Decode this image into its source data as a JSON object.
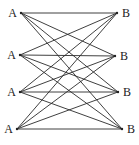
{
  "diagram": {
    "type": "complete-bipartite-graph",
    "name": "K4,4",
    "left_nodes": [
      {
        "id": "A1",
        "label": "A"
      },
      {
        "id": "A2",
        "label": "A"
      },
      {
        "id": "A3",
        "label": "A"
      },
      {
        "id": "A4",
        "label": "A"
      }
    ],
    "right_nodes": [
      {
        "id": "B1",
        "label": "B"
      },
      {
        "id": "B2",
        "label": "B"
      },
      {
        "id": "B3",
        "label": "B"
      },
      {
        "id": "B4",
        "label": "B"
      }
    ],
    "edges": [
      [
        "A1",
        "B1"
      ],
      [
        "A1",
        "B2"
      ],
      [
        "A1",
        "B3"
      ],
      [
        "A1",
        "B4"
      ],
      [
        "A2",
        "B1"
      ],
      [
        "A2",
        "B2"
      ],
      [
        "A2",
        "B3"
      ],
      [
        "A2",
        "B4"
      ],
      [
        "A3",
        "B1"
      ],
      [
        "A3",
        "B2"
      ],
      [
        "A3",
        "B3"
      ],
      [
        "A3",
        "B4"
      ],
      [
        "A4",
        "B1"
      ],
      [
        "A4",
        "B2"
      ],
      [
        "A4",
        "B3"
      ],
      [
        "A4",
        "B4"
      ]
    ],
    "colors": {
      "edge": "#2a2a2a",
      "label": "#222222",
      "background": "#ffffff"
    }
  }
}
